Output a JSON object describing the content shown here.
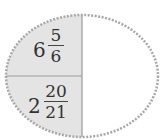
{
  "diagram": {
    "shape": "ellipse",
    "border_color": "#a8a8a8",
    "shaded_color": "#e4e4e4",
    "divider_color": "#9a9a9a",
    "cells": [
      {
        "position": "top-left",
        "whole": "6",
        "numerator": "5",
        "denominator": "6",
        "shaded": true
      },
      {
        "position": "bottom-left",
        "whole": "2",
        "numerator": "20",
        "denominator": "21",
        "shaded": true
      },
      {
        "position": "right",
        "value": "",
        "shaded": false
      }
    ]
  }
}
